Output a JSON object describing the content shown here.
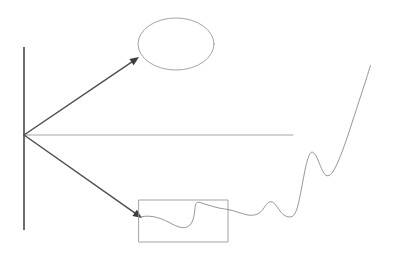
{
  "figure": {
    "background_color": "#ffffff",
    "width": 393,
    "height": 262
  },
  "colors": {
    "axis_line": "#4a4a4a",
    "arrow_line": "#4f4f4f",
    "pointer_line": "#9a9a9a",
    "outline": "#9a9a9a",
    "curve": "#8a8a8a",
    "arrow_head": "#3d3d3d"
  },
  "strokes": {
    "axis_width": 1.6,
    "arrow_width": 1.5,
    "pointer_width": 0.9,
    "outline_width": 0.9,
    "curve_width": 0.9
  },
  "elements": {
    "vertical_axis": {
      "label": "vertical axis line",
      "x": 24,
      "y_top": 47,
      "y_bottom": 230
    },
    "origin_vertex": {
      "label": "convergence vertex",
      "x": 24,
      "y": 135
    },
    "upper_arrow": {
      "label": "upper callout arrow to ellipse",
      "from_x": 24,
      "from_y": 135,
      "to_x": 139,
      "to_y": 57,
      "head_size": 9
    },
    "middle_pointer": {
      "label": "horizontal pointer line",
      "from_x": 24,
      "from_y": 135,
      "to_x": 293,
      "to_y": 135
    },
    "lower_arrow": {
      "label": "lower callout arrow to rectangle",
      "from_x": 24,
      "from_y": 135,
      "to_x": 142,
      "to_y": 218,
      "head_size": 9
    },
    "ellipse_callout": {
      "label": "empty ellipse callout",
      "cx": 176,
      "cy": 44,
      "rx": 38,
      "ry": 26
    },
    "rectangle_callout": {
      "label": "rectangle callout containing magnified curve",
      "x": 139,
      "y": 200,
      "width": 89,
      "height": 42
    }
  },
  "chart_data": {
    "type": "line",
    "title": "",
    "xlabel": "",
    "ylabel": "",
    "grid": false,
    "legend": null,
    "xlim": [
      139,
      372
    ],
    "ylim": [
      65,
      235
    ],
    "series": [
      {
        "name": "magnified-detail-curve",
        "comment": "curve segment drawn inside the rectangle callout (zoomed view)",
        "path": "M 140.5,217 C 152,214 163,219 173,224.5 C 180,228 186,229 190,225 C 194,220.5 194.5,213 195,207.5 C 195.4,203.5 197,201.5 200,202.5 C 205,204 212,206.5 219,208 C 223,208.8 226,209.2 228.5,209.6"
      },
      {
        "name": "main-waveform",
        "comment": "oscillating trace exiting the rectangle and rising steeply at the right",
        "path": "M 228.5,209.6 C 235,210.8 241,213.5 247,214.8 C 253,216 258.5,214.8 262,210.5 C 265.5,206.2 267.5,201.5 271,201.8 C 274.5,202 277,207 280,211 C 283,215 287,217.8 291,216.8 C 295,215.8 297,210 299,201 C 301,192 303,180 305,170 C 307,160.5 309,154 311,152.5 C 313,151 315.5,154 318,160 C 320.5,166 322.5,172 325,174.5 C 327.5,177 330.5,176 334,170 C 338,163 343,150 348,135 C 353,120 360,98 366,80 C 368,73.5 369.5,68.5 370.5,65.5"
      }
    ],
    "annotations": [
      {
        "name": "ellipse-region",
        "shape": "ellipse",
        "cx": 176,
        "cy": 44,
        "rx": 38,
        "ry": 26,
        "text": ""
      },
      {
        "name": "rectangle-region",
        "shape": "rect",
        "x": 139,
        "y": 200,
        "width": 89,
        "height": 42,
        "text": ""
      }
    ]
  }
}
